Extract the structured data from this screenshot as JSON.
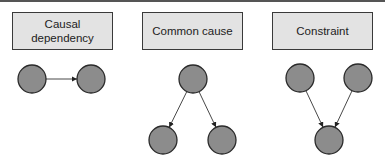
{
  "panels": [
    {
      "title": "Causal\ndependency",
      "box": {
        "left": 12,
        "width": 102
      },
      "nodes": [
        {
          "id": "A",
          "cx": 32,
          "cy": 79,
          "r": 14
        },
        {
          "id": "B",
          "cx": 91,
          "cy": 79,
          "r": 14
        }
      ],
      "edges": [
        {
          "from": "A",
          "to": "B"
        }
      ]
    },
    {
      "title": "Common cause",
      "box": {
        "left": 142,
        "width": 102
      },
      "nodes": [
        {
          "id": "C",
          "cx": 193,
          "cy": 79,
          "r": 14
        },
        {
          "id": "D",
          "cx": 163,
          "cy": 140,
          "r": 14
        },
        {
          "id": "E",
          "cx": 222,
          "cy": 140,
          "r": 14
        }
      ],
      "edges": [
        {
          "from": "C",
          "to": "D"
        },
        {
          "from": "C",
          "to": "E"
        }
      ]
    },
    {
      "title": "Constraint",
      "box": {
        "left": 272,
        "width": 101
      },
      "nodes": [
        {
          "id": "F",
          "cx": 300,
          "cy": 78,
          "r": 14
        },
        {
          "id": "G",
          "cx": 358,
          "cy": 78,
          "r": 14
        },
        {
          "id": "H",
          "cx": 329,
          "cy": 140,
          "r": 14
        }
      ],
      "edges": [
        {
          "from": "F",
          "to": "H"
        },
        {
          "from": "G",
          "to": "H"
        }
      ]
    }
  ],
  "colors": {
    "box_fill": "#e3e3e3",
    "box_border": "#3a3a3a",
    "node_fill": "#8c8c8c",
    "node_stroke": "#2a2a2a",
    "edge": "#333333"
  }
}
